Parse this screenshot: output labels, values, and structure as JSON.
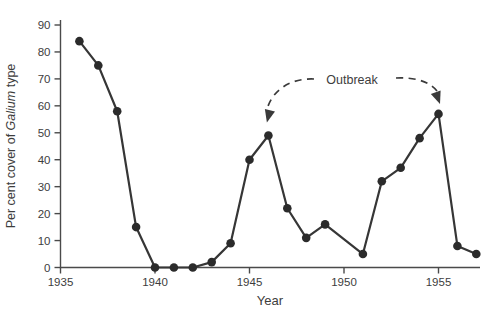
{
  "figure": {
    "background": "#ffffff",
    "line_color": "#363636",
    "marker_color": "#2b2b2b",
    "axis_color": "#4a4a4a",
    "text_color": "#3d3d3d",
    "arrow_color": "#3a3a3a"
  },
  "chart_data": {
    "type": "line",
    "title": "",
    "xlabel": "Year",
    "ylabel": "Per cent cover of Galium type",
    "ylabel_prefix": "Per cent cover of ",
    "ylabel_italic": "Galium",
    "ylabel_suffix": " type",
    "xlim": [
      1935,
      1957.5
    ],
    "ylim": [
      0,
      90
    ],
    "x_ticks": [
      1935,
      1940,
      1945,
      1950,
      1955
    ],
    "y_ticks": [
      0,
      10,
      20,
      30,
      40,
      50,
      60,
      70,
      80,
      90
    ],
    "grid": false,
    "legend": null,
    "marker": "filled-circle",
    "points": [
      [
        1936,
        84
      ],
      [
        1937,
        75
      ],
      [
        1938,
        58
      ],
      [
        1939,
        15
      ],
      [
        1940,
        0
      ],
      [
        1941,
        0
      ],
      [
        1942,
        0
      ],
      [
        1943,
        2
      ],
      [
        1944,
        9
      ],
      [
        1945,
        40
      ],
      [
        1946,
        49
      ],
      [
        1947,
        22
      ],
      [
        1948,
        11
      ],
      [
        1949,
        16
      ],
      [
        1951,
        5
      ],
      [
        1952,
        32
      ],
      [
        1953,
        37
      ],
      [
        1954,
        48
      ],
      [
        1955,
        57
      ],
      [
        1956,
        8
      ],
      [
        1957,
        5
      ]
    ],
    "note": "no sample point at 1950; line runs straight from 1949 to 1951",
    "annotation": {
      "label": "Outbreak",
      "targets": [
        [
          1946,
          49
        ],
        [
          1955,
          57
        ]
      ]
    }
  }
}
